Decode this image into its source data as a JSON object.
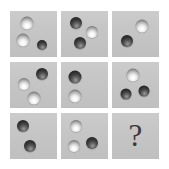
{
  "figure": {
    "type": "matrix-reasoning-puzzle",
    "rows": 3,
    "columns": 3,
    "background_color": "#ffffff",
    "tile_color": "#c6c6c6",
    "light_sphere_color": "#ffffff",
    "dark_sphere_color": "#2a2a2a",
    "question_mark_color": "#3a3a3a",
    "missing_cell_symbol": "?"
  },
  "cells": [
    {
      "id": "cell-1",
      "row": 1,
      "column": 1,
      "position_label": "top-left",
      "sphere_count": 3,
      "light_count": 2,
      "dark_count": 1,
      "spheres": [
        {
          "shade": "light",
          "x_pct": 36,
          "y_pct": 25,
          "size_px": 13
        },
        {
          "shade": "light",
          "x_pct": 27,
          "y_pct": 63,
          "size_px": 13
        },
        {
          "shade": "dark",
          "x_pct": 68,
          "y_pct": 74,
          "size_px": 10
        }
      ]
    },
    {
      "id": "cell-2",
      "row": 1,
      "column": 2,
      "position_label": "top-center",
      "sphere_count": 3,
      "light_count": 1,
      "dark_count": 2,
      "spheres": [
        {
          "shade": "dark",
          "x_pct": 31,
          "y_pct": 25,
          "size_px": 12
        },
        {
          "shade": "light",
          "x_pct": 66,
          "y_pct": 45,
          "size_px": 12
        },
        {
          "shade": "dark",
          "x_pct": 41,
          "y_pct": 70,
          "size_px": 12
        }
      ]
    },
    {
      "id": "cell-3",
      "row": 1,
      "column": 3,
      "position_label": "top-right",
      "sphere_count": 2,
      "light_count": 1,
      "dark_count": 1,
      "spheres": [
        {
          "shade": "light",
          "x_pct": 64,
          "y_pct": 32,
          "size_px": 13
        },
        {
          "shade": "dark",
          "x_pct": 31,
          "y_pct": 66,
          "size_px": 12
        }
      ]
    },
    {
      "id": "cell-4",
      "row": 2,
      "column": 1,
      "position_label": "middle-left",
      "sphere_count": 3,
      "light_count": 2,
      "dark_count": 1,
      "spheres": [
        {
          "shade": "dark",
          "x_pct": 69,
          "y_pct": 27,
          "size_px": 12
        },
        {
          "shade": "light",
          "x_pct": 30,
          "y_pct": 48,
          "size_px": 12
        },
        {
          "shade": "light",
          "x_pct": 50,
          "y_pct": 78,
          "size_px": 13
        }
      ]
    },
    {
      "id": "cell-5",
      "row": 2,
      "column": 2,
      "position_label": "middle-center",
      "sphere_count": 2,
      "light_count": 1,
      "dark_count": 1,
      "spheres": [
        {
          "shade": "dark",
          "x_pct": 29,
          "y_pct": 32,
          "size_px": 13
        },
        {
          "shade": "light",
          "x_pct": 29,
          "y_pct": 73,
          "size_px": 13
        }
      ]
    },
    {
      "id": "cell-6",
      "row": 2,
      "column": 3,
      "position_label": "middle-right",
      "sphere_count": 3,
      "light_count": 1,
      "dark_count": 2,
      "spheres": [
        {
          "shade": "light",
          "x_pct": 44,
          "y_pct": 28,
          "size_px": 13
        },
        {
          "shade": "dark",
          "x_pct": 29,
          "y_pct": 70,
          "size_px": 11
        },
        {
          "shade": "dark",
          "x_pct": 69,
          "y_pct": 64,
          "size_px": 11
        }
      ]
    },
    {
      "id": "cell-7",
      "row": 3,
      "column": 1,
      "position_label": "bottom-left",
      "sphere_count": 2,
      "light_count": 0,
      "dark_count": 2,
      "spheres": [
        {
          "shade": "dark",
          "x_pct": 27,
          "y_pct": 28,
          "size_px": 12
        },
        {
          "shade": "dark",
          "x_pct": 42,
          "y_pct": 72,
          "size_px": 12
        }
      ]
    },
    {
      "id": "cell-8",
      "row": 3,
      "column": 2,
      "position_label": "bottom-center",
      "sphere_count": 3,
      "light_count": 2,
      "dark_count": 1,
      "spheres": [
        {
          "shade": "light",
          "x_pct": 31,
          "y_pct": 28,
          "size_px": 12
        },
        {
          "shade": "light",
          "x_pct": 27,
          "y_pct": 72,
          "size_px": 12
        },
        {
          "shade": "dark",
          "x_pct": 65,
          "y_pct": 65,
          "size_px": 12
        }
      ]
    },
    {
      "id": "cell-9",
      "row": 3,
      "column": 3,
      "position_label": "bottom-right",
      "sphere_count": 0,
      "light_count": 0,
      "dark_count": 0,
      "is_missing": true,
      "symbol": "?",
      "spheres": []
    }
  ]
}
